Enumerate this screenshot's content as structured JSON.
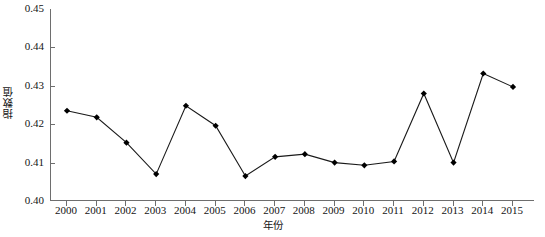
{
  "chart_data": {
    "type": "line",
    "title": "",
    "xlabel": "年份",
    "ylabel": "指数值",
    "categories": [
      "2000",
      "2001",
      "2002",
      "2003",
      "2004",
      "2005",
      "2006",
      "2007",
      "2008",
      "2009",
      "2010",
      "2011",
      "2012",
      "2013",
      "2014",
      "2015"
    ],
    "values": [
      0.4235,
      0.4218,
      0.4152,
      0.407,
      0.4248,
      0.4196,
      0.4065,
      0.4115,
      0.4122,
      0.41,
      0.4093,
      0.4103,
      0.428,
      0.41,
      0.4332,
      0.4297
    ],
    "ylim": [
      0.4,
      0.45
    ],
    "xlim": [
      2000,
      2015
    ],
    "ytick_labels": [
      "0.45",
      "0.44",
      "0.43",
      "0.42",
      "0.41",
      "0.40"
    ],
    "ytick_values": [
      0.45,
      0.44,
      0.43,
      0.42,
      0.41,
      0.4
    ],
    "grid": false,
    "legend": "none",
    "marker": "diamond",
    "line_color": "#1a1a1a",
    "marker_color": "#000000",
    "axis_color": "#6e6e6e",
    "background": "#ffffff"
  }
}
